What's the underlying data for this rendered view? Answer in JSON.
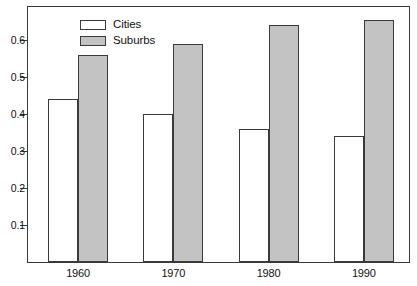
{
  "chart_data": {
    "type": "bar",
    "title": "",
    "subtitle": "",
    "xlabel": "",
    "ylabel": "",
    "categories": [
      "1960",
      "1970",
      "1980",
      "1990"
    ],
    "series": [
      {
        "name": "Cities",
        "color": "#ffffff",
        "values": [
          0.44,
          0.4,
          0.36,
          0.34
        ]
      },
      {
        "name": "Suburbs",
        "color": "#c3c3c3",
        "values": [
          0.56,
          0.59,
          0.64,
          0.655
        ]
      }
    ],
    "ylim": [
      0,
      0.69
    ],
    "yticks": [
      0.1,
      0.2,
      0.3,
      0.4,
      0.5,
      0.6
    ],
    "ytick_labels": [
      "0.1",
      "0.2",
      "0.3",
      "0.4",
      "0.5",
      "0.6"
    ],
    "grid": false,
    "legend_position": "top-left",
    "annotations": []
  },
  "legend": {
    "items": [
      {
        "label": "Cities",
        "swatch": "white-swatch"
      },
      {
        "label": "Suburbs",
        "swatch": "gray-swatch"
      }
    ]
  },
  "axes": {
    "x_tick_labels": [
      "1960",
      "1970",
      "1980",
      "1990"
    ],
    "y_tick_labels": [
      "0.1",
      "0.2",
      "0.3",
      "0.4",
      "0.5",
      "0.6"
    ]
  }
}
